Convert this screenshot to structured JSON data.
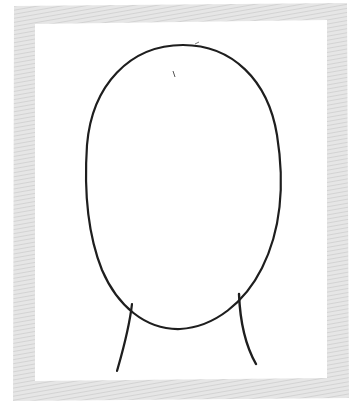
{
  "image": {
    "description": "Hand-drawn sketch of a blank oval face outline with neck lines inside a gray hatched frame",
    "frame_color": "#dcdcdc",
    "background": "#ffffff",
    "stroke_color": "#1e1e1e"
  },
  "frame": {
    "outer": {
      "x": 12,
      "y": 3,
      "w": 336,
      "h": 397
    },
    "thickness": 21
  },
  "face": {
    "cx": 183,
    "cy": 186,
    "rx": 98,
    "ry": 144
  },
  "neck": {
    "left": "M131,303 C128,330 122,350 116,372",
    "right": "M239,290 C240,318 244,342 256,364"
  }
}
